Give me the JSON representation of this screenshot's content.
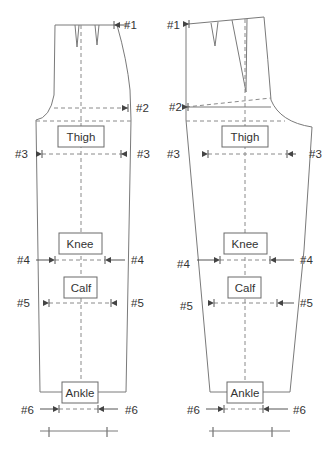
{
  "diagram": {
    "pieces": [
      {
        "name": "front",
        "labels": {
          "thigh": "Thigh",
          "knee": "Knee",
          "calf": "Calf",
          "ankle": "Ankle"
        },
        "markers": {
          "m1": "#1",
          "m2": "#2",
          "m3_left": "#3",
          "m3_right": "#3",
          "m4_left": "#4",
          "m4_right": "#4",
          "m5_left": "#5",
          "m5_right": "#5",
          "m6_left": "#6",
          "m6_right": "#6"
        }
      },
      {
        "name": "back",
        "labels": {
          "thigh": "Thigh",
          "knee": "Knee",
          "calf": "Calf",
          "ankle": "Ankle"
        },
        "markers": {
          "m1": "#1",
          "m2": "#2",
          "m3_left": "#3",
          "m3_right": "#3",
          "m4_left": "#4",
          "m4_right": "#4",
          "m5_left": "#5",
          "m5_right": "#5",
          "m6_left": "#6",
          "m6_right": "#6"
        }
      }
    ],
    "colors": {
      "outline": "#7a7a7a",
      "text": "#333333"
    }
  }
}
